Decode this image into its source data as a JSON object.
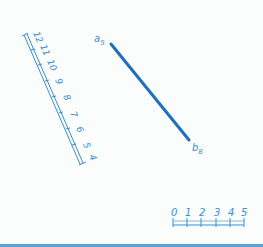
{
  "colors": {
    "line": "#1f6fbf",
    "annotation": "#3a8fd0",
    "background": "#fbfcfc",
    "bottom_bar": "#5aa3d9"
  },
  "segment": {
    "start_label": "a",
    "start_sub": "5",
    "end_label": "b",
    "end_sub": "8"
  },
  "elevation_scale": {
    "labels": [
      "12",
      "11",
      "10",
      "9",
      "8",
      "7",
      "6",
      "5",
      "4"
    ]
  },
  "horizontal_scale": {
    "labels": [
      "0",
      "1",
      "2",
      "3",
      "4",
      "5"
    ]
  }
}
